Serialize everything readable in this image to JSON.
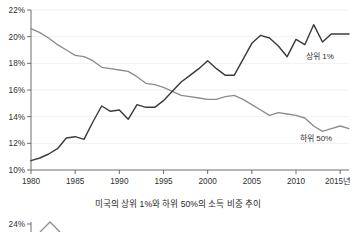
{
  "chart_data": {
    "type": "line",
    "title": "",
    "caption": "미국의 상위 1%와 하위 50%의 소득 비중 추이",
    "xlabel": "",
    "ylabel": "",
    "xlim": [
      1980,
      2016
    ],
    "ylim": [
      10,
      22
    ],
    "grid": true,
    "legend_position": "inline-right",
    "y_tick_labels": [
      "22%",
      "20%",
      "18%",
      "16%",
      "14%",
      "12%",
      "10%"
    ],
    "y_tick_values": [
      22,
      20,
      18,
      16,
      14,
      12,
      10
    ],
    "x_tick_labels": [
      "1980",
      "1985",
      "1990",
      "1995",
      "2000",
      "2005",
      "2015년"
    ],
    "x_tick_values": [
      1980,
      1985,
      1990,
      1995,
      2000,
      2005,
      2010,
      2015
    ],
    "x_tick_labels_full": [
      "1980",
      "1985",
      "1990",
      "1995",
      "2000",
      "2005",
      "2010",
      "2015년"
    ],
    "x": [
      1980,
      1981,
      1982,
      1983,
      1984,
      1985,
      1986,
      1987,
      1988,
      1989,
      1990,
      1991,
      1992,
      1993,
      1994,
      1995,
      1996,
      1997,
      1998,
      1999,
      2000,
      2001,
      2002,
      2003,
      2004,
      2005,
      2006,
      2007,
      2008,
      2009,
      2010,
      2011,
      2012,
      2013,
      2014,
      2015,
      2016
    ],
    "series": [
      {
        "name": "상위 1%",
        "color": "#3c3c3c",
        "label": "상위 1%",
        "values": [
          10.7,
          10.9,
          11.2,
          11.6,
          12.4,
          12.5,
          12.3,
          13.6,
          14.8,
          14.4,
          14.5,
          13.8,
          14.9,
          14.7,
          14.7,
          15.2,
          15.9,
          16.6,
          17.1,
          17.6,
          18.2,
          17.6,
          17.1,
          17.1,
          18.3,
          19.5,
          20.1,
          19.9,
          19.3,
          18.5,
          19.8,
          19.4,
          20.9,
          19.6,
          20.2,
          20.2,
          20.2
        ]
      },
      {
        "name": "하위 50%",
        "color": "#8c8c8c",
        "label": "하위 50%",
        "values": [
          20.6,
          20.3,
          19.9,
          19.4,
          19.0,
          18.6,
          18.5,
          18.2,
          17.7,
          17.6,
          17.5,
          17.4,
          17.0,
          16.5,
          16.4,
          16.2,
          15.9,
          15.6,
          15.5,
          15.4,
          15.3,
          15.3,
          15.5,
          15.6,
          15.3,
          14.9,
          14.5,
          14.1,
          14.3,
          14.2,
          14.1,
          13.9,
          13.3,
          12.9,
          13.1,
          13.3,
          13.1
        ]
      }
    ],
    "annotations": [
      {
        "text": "상위 1%",
        "x": 2011.5,
        "y": 18.5
      },
      {
        "text": "하위 50%",
        "x": 2010.5,
        "y": 12.4
      }
    ]
  },
  "next_chart_preview": {
    "y_tick_label": "24%"
  }
}
